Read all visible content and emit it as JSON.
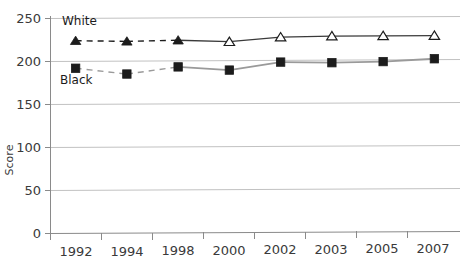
{
  "chart_data": {
    "type": "line",
    "title": "",
    "subtitle": "",
    "xlabel": "",
    "ylabel": "Score",
    "categories": [
      "1992",
      "1994",
      "1998",
      "2000",
      "2002",
      "2003",
      "2005",
      "2007"
    ],
    "ylim": [
      0,
      250
    ],
    "y_ticks": [
      0,
      50,
      100,
      150,
      200,
      250
    ],
    "y_tick_labels": [
      "0",
      "50",
      "100",
      "150",
      "200",
      "250"
    ],
    "grid": true,
    "grid_axis": "y",
    "legend_position": "inline-annotation",
    "series": [
      {
        "name": "White",
        "marker": "triangle",
        "values": [
          224,
          223,
          224,
          222,
          227,
          228,
          228,
          228
        ],
        "segment_styles": [
          "dashed",
          "dashed",
          "solid",
          "solid",
          "solid",
          "solid",
          "solid"
        ],
        "marker_fill": [
          "filled",
          "filled",
          "filled",
          "open",
          "open",
          "open",
          "open",
          "open"
        ],
        "color": "#000000",
        "label": "White",
        "label_x": 1992,
        "label_y": 239
      },
      {
        "name": "Black",
        "marker": "square",
        "values": [
          192,
          185,
          193,
          189,
          198,
          197,
          198,
          201
        ],
        "segment_styles": [
          "dashed",
          "dashed",
          "solid",
          "solid",
          "solid",
          "solid",
          "solid"
        ],
        "marker_fill": [
          "filled",
          "filled",
          "filled",
          "filled",
          "filled",
          "filled",
          "filled",
          "filled"
        ],
        "color": "#000000",
        "label": "Black",
        "label_x": 1992,
        "label_y": 175
      }
    ],
    "annotations": [
      {
        "text": "White",
        "series": "White"
      },
      {
        "text": "Black",
        "series": "Black"
      }
    ],
    "colors": {
      "gridline": "#bdbdbd",
      "axis": "#6e6e6e",
      "series_line": "#1c1c1c",
      "series_line_light": "#9a9a9a",
      "text": "#3a3a3a",
      "background": "#ffffff"
    }
  },
  "axes": {
    "y_title": "Score",
    "y_labels": [
      "250",
      "200",
      "150",
      "100",
      "50",
      "0"
    ],
    "x_labels": [
      "1992",
      "1994",
      "1998",
      "2000",
      "2002",
      "2003",
      "2005",
      "2007"
    ]
  },
  "labels": {
    "white": "White",
    "black": "Black"
  }
}
